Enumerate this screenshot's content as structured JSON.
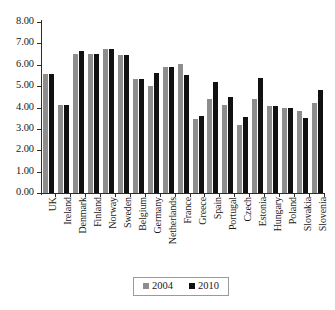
{
  "chart_data": {
    "type": "bar",
    "title": "",
    "subtitle": "",
    "xlabel": "",
    "ylabel": "",
    "ylim": [
      0,
      8
    ],
    "ytick_step": 1,
    "ytick_labels": [
      "0.00",
      "1.00",
      "2.00",
      "3.00",
      "4.00",
      "5.00",
      "6.00",
      "7.00",
      "8.00"
    ],
    "grid": false,
    "legend_position": "bottom-center",
    "categories": [
      "UK",
      "Ireland",
      "Denmark",
      "Finland",
      "Norway",
      "Sweden",
      "Belgium",
      "Germany",
      "Netherlands",
      "France",
      "Greece",
      "Spain",
      "Portugal",
      "Czech",
      "Estonia",
      "Hungary",
      "Poland",
      "Slovakia",
      "Slovenia"
    ],
    "series": [
      {
        "name": "2004",
        "color": "#8d8d8d",
        "values": [
          5.56,
          4.1,
          6.5,
          6.52,
          6.74,
          6.46,
          5.35,
          5.0,
          5.88,
          6.05,
          3.48,
          4.42,
          4.13,
          3.17,
          4.42,
          4.05,
          4.0,
          3.85,
          4.2
        ]
      },
      {
        "name": "2010",
        "color": "#111111",
        "values": [
          5.56,
          4.1,
          6.66,
          6.52,
          6.72,
          6.46,
          5.35,
          5.62,
          5.88,
          5.5,
          3.58,
          5.18,
          4.5,
          3.56,
          5.37,
          4.05,
          4.0,
          3.52,
          4.82
        ]
      }
    ],
    "legend": [
      {
        "label": "2004",
        "color": "#8d8d8d"
      },
      {
        "label": "2010",
        "color": "#111111"
      }
    ]
  }
}
